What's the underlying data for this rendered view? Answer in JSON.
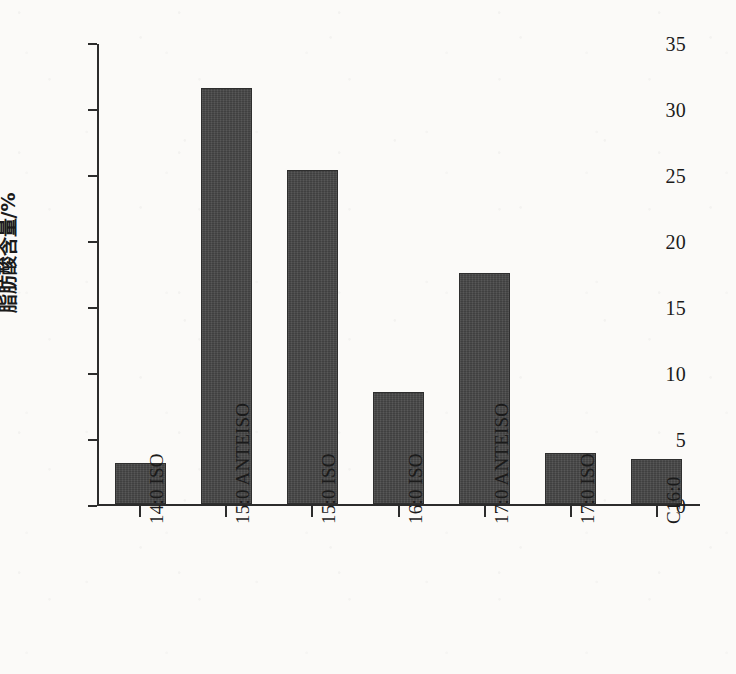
{
  "chart_data": {
    "type": "bar",
    "title": "",
    "subtitle": "",
    "xlabel": "",
    "ylabel": "脂肪酸含量/%",
    "ylim": [
      0,
      35
    ],
    "ytick_values": [
      0,
      5,
      10,
      15,
      20,
      25,
      30,
      35
    ],
    "ytick_labels": [
      "0",
      "5",
      "10",
      "15",
      "20",
      "25",
      "30",
      "35"
    ],
    "grid": false,
    "legend": null,
    "legend_position": "none",
    "bar_color": "#474747",
    "axis_color": "#2c2c2c",
    "background_color": "#fbfaf8",
    "categories": [
      "14:0 ISO",
      "15:0 ANTEISO",
      "15:0 ISO",
      "16:0 ISO",
      "17:0 ANTEISO",
      "17:0 ISO",
      "C16:0"
    ],
    "values": [
      3.1,
      31.5,
      25.3,
      8.5,
      17.5,
      3.9,
      3.4
    ],
    "series": [
      {
        "name": "脂肪酸含量",
        "values": [
          3.1,
          31.5,
          25.3,
          8.5,
          17.5,
          3.9,
          3.4
        ]
      }
    ],
    "xtick_label_rotation": 90
  }
}
